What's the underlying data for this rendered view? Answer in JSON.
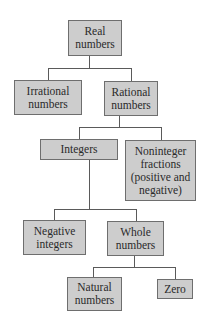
{
  "diagram": {
    "type": "tree",
    "nodes": {
      "real": "Real\nnumbers",
      "irrational": "Irrational\nnumbers",
      "rational": "Rational\nnumbers",
      "integers": "Integers",
      "noninteger": "Noninteger\nfractions\n(positive and\nnegative)",
      "negative": "Negative\nintegers",
      "whole": "Whole\nnumbers",
      "natural": "Natural\nnumbers",
      "zero": "Zero"
    },
    "edges": [
      [
        "Real numbers",
        "Irrational numbers"
      ],
      [
        "Real numbers",
        "Rational numbers"
      ],
      [
        "Rational numbers",
        "Integers"
      ],
      [
        "Rational numbers",
        "Noninteger fractions (positive and negative)"
      ],
      [
        "Integers",
        "Negative integers"
      ],
      [
        "Integers",
        "Whole numbers"
      ],
      [
        "Whole numbers",
        "Natural numbers"
      ],
      [
        "Whole numbers",
        "Zero"
      ]
    ],
    "colors": {
      "box_fill": "#cdcdcd",
      "box_border": "#6e6e6e",
      "connector": "#5a5a5a"
    }
  }
}
